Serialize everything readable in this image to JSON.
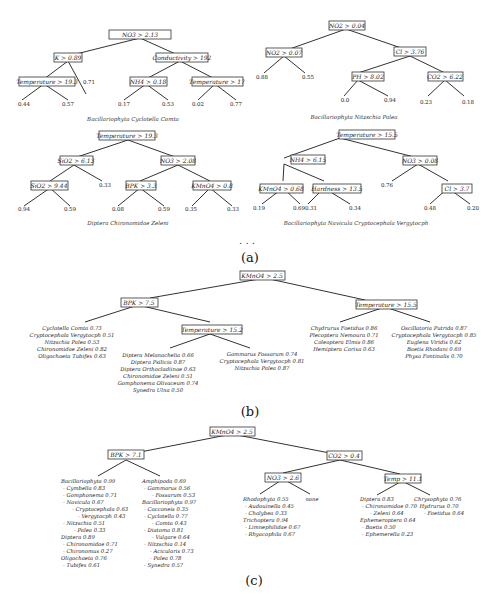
{
  "header": {
    "page_number": "174",
    "running_title": "W. Dzeroski et al."
  },
  "panel_a": {
    "label": "(a)",
    "ellipsis": ". . .",
    "trees": [
      {
        "caption": "Bacillariophyta Cyclotella Comta",
        "nodes": [
          "NO3 > 2.13",
          "K > 0.89",
          "Conductivity > 192",
          "Temperature > 19.3",
          "NH4 > 0.18",
          "Temperature > 17"
        ],
        "leaves": [
          "0.71",
          "0.44",
          "0.57",
          "0.17",
          "0.53",
          "0.02",
          "0.77"
        ]
      },
      {
        "caption": "Bacillariophyta Nitzschia Palea",
        "nodes": [
          "NO2 > 0.04",
          "NO2 > 0.07",
          "Cl > 3.76",
          "PH > 8.02",
          "CO2 > 6.22"
        ],
        "leaves": [
          "0.88",
          "0.55",
          "0.0",
          "0.94",
          "0.23",
          "0.18"
        ]
      },
      {
        "caption": "Diptera Chironomidae Zeleni",
        "nodes": [
          "Temperature > 19.3",
          "SiO2 > 6.13",
          "NO3 > 2.08",
          "SiO2 > 9.44",
          "BPK > 3.3",
          "KMnO4 > 0.8"
        ],
        "leaves": [
          "0.33",
          "0.94",
          "0.59",
          "0.08",
          "0.59",
          "0.35",
          "0.33"
        ]
      },
      {
        "caption": "Bacillariophyta Navicula Cryptocephala Vergytocph",
        "nodes": [
          "Temperature > 15.5",
          "NH4 > 6.15",
          "NO3 > 0.08",
          "KMnO4 > 0.68",
          "Hardness > 13.5",
          "Cl > 3.7"
        ],
        "leaves": [
          "0.76",
          "0.19",
          "0.69",
          "0.31",
          "0.34",
          "0.48",
          "0.20"
        ]
      }
    ]
  },
  "panel_b": {
    "label": "(b)",
    "nodes": [
      "KMnO4 > 2.5",
      "BPK > 7.5",
      "Temperature > 15.5",
      "Temperature > 15.2"
    ],
    "edge_yes": "yes",
    "edge_no": "no",
    "leaves": {
      "bpk_yes": [
        "Cyclotella Comta 0.73",
        "Cryptocephala Vergytocph 0.51",
        "Nitzschia Palea 0.53",
        "Chironomidae Zeleni 0.82",
        "Oligochaeta Tubifex 0.63"
      ],
      "temp152_yes": [
        "Diptera Melanochelia 0.66",
        "Diptera Psilicia 0.87",
        "Diptera Orthocladiinae 0.63",
        "Chironomidae Zeleni 0.51",
        "Gomphonema Olivaceum 0.74",
        "Synedra Ulna 0.50"
      ],
      "temp152_no": [
        "Gammarus Fossarum 0.74",
        "Cryptocephala Vergytocph 0.81",
        "Nitzschia Palea 0.87"
      ],
      "temp155_yes": [
        "Chydrurus Foetidus 0.86",
        "Plecoptera Nemoura 0.71",
        "Coleoptera Elmis 0.86",
        "Hemiptera Corixa 0.63"
      ],
      "temp155_no": [
        "Oscillatoria Putrida 0.87",
        "Cryptocephala Vergytocph 0.85",
        "Euglena Viridis 0.62",
        "Baetis Rhodani 0.69",
        "Physa Fontinalis 0.70"
      ]
    }
  },
  "panel_c": {
    "label": "(c)",
    "nodes": [
      "KMnO4 > 2.5",
      "BPK > 7.1",
      "CO2 > 0.4",
      "NO3 > 2.6",
      "Temp > 11.1"
    ],
    "leaves": {
      "bpk_yes": [
        "Bacillariophyta 0.99",
        "- Cymbella 0.83",
        "- Gomphonema 0.71",
        "- Navicula 0.67",
        "- Cryptocephala 0.63",
        "- Vergytocph 0.43",
        "- Nitzschia 0.51",
        "- Palea 0.33",
        "Diptera 0.89",
        "- Chironomidae 0.71",
        "- Chironomus 0.27",
        "Oligochaeta 0.76",
        "- Tubifex 0.61"
      ],
      "bpk_no": [
        "Amphipoda 0.69",
        "- Gammarus 0.56",
        "- Fossarum 0.53",
        "Bacillariophyta 0.97",
        "- Cocconeis 0.35",
        "- Cyclotella 0.77",
        "- Comta 0.43",
        "- Diatoma 0.81",
        "- Vulgare 0.64",
        "- Nitzschia 0.14",
        "- Acicularis 0.73",
        "- Palea 0.78",
        "- Synedra 0.57"
      ],
      "no3_yes": [
        "Rhodophyta 0.55",
        "- Audouinella 0.45",
        "- Chalybea 0.33",
        "Trichoptera 0.94",
        "- Limnephilidae 0.67",
        "- Rhyacophila 0.67"
      ],
      "no3_no": [
        "none"
      ],
      "temp_yes": [
        "Diptera 0.83",
        "- Chironomidae 0.70",
        "- Zeleni 0.64",
        "Ephemeroptera 0.64",
        "- Baetis 0.50",
        "- Ephemerella 0.23"
      ],
      "temp_no": [
        "Chrysophyta 0.76",
        "- Hydrurus 0.70",
        "- Foetidus 0.64"
      ]
    }
  }
}
